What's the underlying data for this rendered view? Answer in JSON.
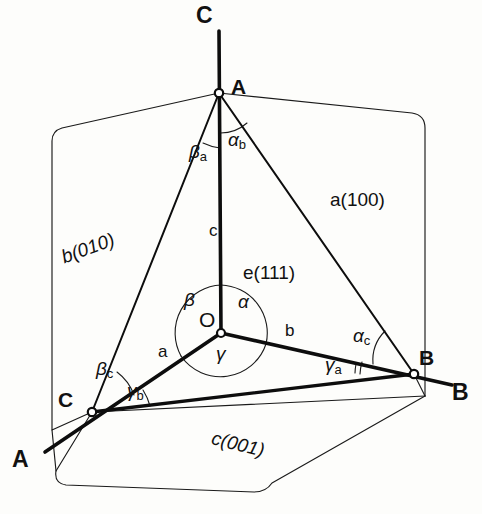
{
  "figure": {
    "background_color": "#fdfdfb",
    "line_color": "#111111"
  },
  "axes": [
    {
      "id": "axis-c-top",
      "label": "C",
      "x": 196,
      "y": 4,
      "role": "c-axis positive end"
    },
    {
      "id": "axis-a-bottom",
      "label": "A",
      "x": 12,
      "y": 448,
      "role": "a-axis positive end"
    },
    {
      "id": "axis-b-right",
      "label": "B",
      "x": 452,
      "y": 381,
      "role": "b-axis positive end"
    }
  ],
  "vertices": [
    {
      "id": "vertex-a",
      "label": "A",
      "x": 231,
      "y": 78,
      "point_x": 219,
      "point_y": 93
    },
    {
      "id": "vertex-b",
      "label": "B",
      "x": 419,
      "y": 349,
      "point_x": 414,
      "point_y": 374
    },
    {
      "id": "vertex-c",
      "label": "C",
      "x": 60,
      "y": 391,
      "point_x": 92,
      "point_y": 412
    },
    {
      "id": "origin",
      "label": "O",
      "x": 199,
      "y": 311,
      "point_x": 221,
      "point_y": 333
    }
  ],
  "edge_labels": [
    {
      "id": "edge-c",
      "label": "c",
      "x": 209,
      "y": 228
    },
    {
      "id": "edge-a",
      "label": "a",
      "x": 158,
      "y": 348
    },
    {
      "id": "edge-b",
      "label": "b",
      "x": 285,
      "y": 328
    }
  ],
  "face_labels": [
    {
      "id": "face-a",
      "label": "a(100)",
      "x": 330,
      "y": 193,
      "rotation": 0
    },
    {
      "id": "face-b",
      "label": "b(010)",
      "x": 62,
      "y": 250,
      "rotation": -18
    },
    {
      "id": "face-c",
      "label": "c(001)",
      "x": 212,
      "y": 432,
      "rotation": 14
    },
    {
      "id": "face-e",
      "label": "e(111)",
      "x": 243,
      "y": 267,
      "rotation": 0
    }
  ],
  "angles": [
    {
      "id": "angle-alpha",
      "glyph": "α",
      "sub": "",
      "x": 238,
      "y": 297
    },
    {
      "id": "angle-beta",
      "glyph": "β",
      "sub": "",
      "x": 186,
      "y": 295
    },
    {
      "id": "angle-gamma",
      "glyph": "γ",
      "sub": "",
      "x": 218,
      "y": 348
    },
    {
      "id": "angle-alpha-b",
      "glyph": "α",
      "sub": "b",
      "x": 228,
      "y": 134
    },
    {
      "id": "angle-beta-a",
      "glyph": "β",
      "sub": "a",
      "x": 191,
      "y": 146
    },
    {
      "id": "angle-alpha-c",
      "glyph": "α",
      "sub": "c",
      "x": 355,
      "y": 330
    },
    {
      "id": "angle-gamma-a",
      "glyph": "γ",
      "sub": "a",
      "x": 327,
      "y": 358
    },
    {
      "id": "angle-beta-c",
      "glyph": "β",
      "sub": "c",
      "x": 98,
      "y": 363
    },
    {
      "id": "angle-gamma-b",
      "glyph": "γ",
      "sub": "b",
      "x": 128,
      "y": 385
    }
  ],
  "geometry": {
    "heavy_stroke_width": 3.2,
    "thin_stroke_width": 1.1,
    "arc_stroke_width": 1.0,
    "c_axis_line": "M219,31 L221,333",
    "a_axis_line": "M221,333 L45,452",
    "b_axis_line": "M221,333 L452,385",
    "tri_a_b": "M219,93 L414,374",
    "tri_a_c": "M219,93 L92,412",
    "tri_b_c": "M92,412 L414,374",
    "plane_b_010": "M219,93 L61,128 Q52,130 52,139 L52,430 L92,412",
    "plane_a_100": "M219,93 L414,113 Q425,115 425,126 L425,395 L414,374",
    "plane_c_001": "M92,412 L55,472 Q57,484 68,486 L258,492 Q268,492 272,484 L414,374",
    "thin_to_vertex_c": "M92,412 L425,395",
    "thin_c_left_down": "M52,430 L55,472"
  }
}
